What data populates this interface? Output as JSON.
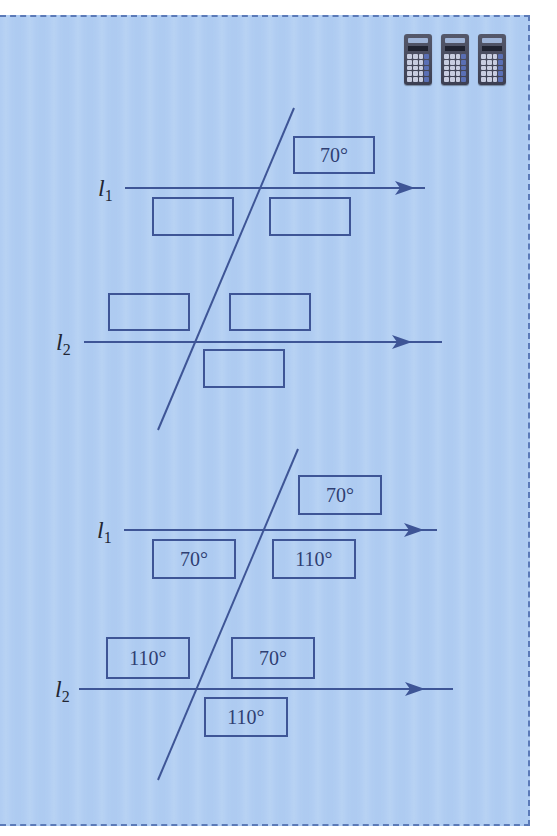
{
  "panel": {
    "background": "#b0cdf2",
    "border_color": "#5b7ab8",
    "line_color": "#3e5596"
  },
  "toolbar": {
    "calculators": [
      {
        "icon": "calculator-icon"
      },
      {
        "icon": "calculator-icon"
      },
      {
        "icon": "calculator-icon"
      }
    ]
  },
  "diagrams": [
    {
      "id": "question",
      "lines": {
        "l1": {
          "label": "l",
          "subscript": "1"
        },
        "l2": {
          "label": "l",
          "subscript": "2"
        }
      },
      "boxes": {
        "l1_above_right": "70°",
        "l1_below_left": "",
        "l1_below_right": "",
        "l2_above_left": "",
        "l2_above_right": "",
        "l2_below_right": ""
      }
    },
    {
      "id": "answer",
      "lines": {
        "l1": {
          "label": "l",
          "subscript": "1"
        },
        "l2": {
          "label": "l",
          "subscript": "2"
        }
      },
      "boxes": {
        "l1_above_right": "70°",
        "l1_below_left": "70°",
        "l1_below_right": "110°",
        "l2_above_left": "110°",
        "l2_above_right": "70°",
        "l2_below_right": "110°"
      }
    }
  ]
}
